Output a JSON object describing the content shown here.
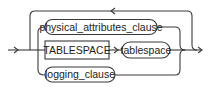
{
  "diagram": {
    "type": "railroad-syntax",
    "nodes": [
      {
        "id": "physical_attributes_clause",
        "label": "physical_attributes_clause",
        "kind": "nonterminal"
      },
      {
        "id": "tablespace_keyword",
        "label": "TABLESPACE",
        "kind": "keyword"
      },
      {
        "id": "tablespace",
        "label": "tablespace",
        "kind": "nonterminal"
      },
      {
        "id": "logging_clause",
        "label": "logging_clause",
        "kind": "nonterminal"
      }
    ],
    "edges": [
      {
        "from": "entry",
        "to": "physical_attributes_clause"
      },
      {
        "from": "entry",
        "to": "tablespace_keyword"
      },
      {
        "from": "entry",
        "to": "logging_clause"
      },
      {
        "from": "tablespace_keyword",
        "to": "tablespace"
      },
      {
        "from": "physical_attributes_clause",
        "to": "exit"
      },
      {
        "from": "tablespace",
        "to": "exit"
      },
      {
        "from": "logging_clause",
        "to": "exit"
      },
      {
        "from": "exit",
        "to": "entry",
        "kind": "repeat-loop"
      }
    ],
    "colors": {
      "stroke": "#3a3a3a",
      "text": "#222222",
      "background": "#ffffff"
    }
  }
}
